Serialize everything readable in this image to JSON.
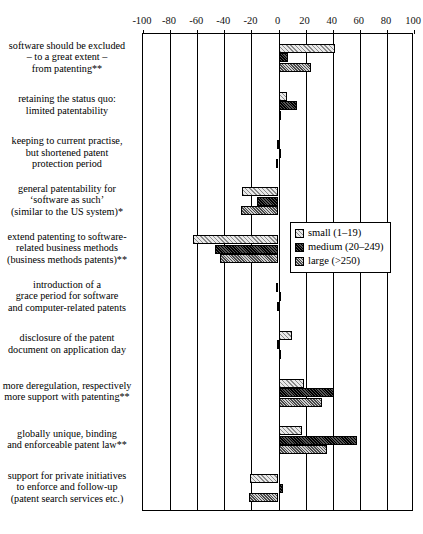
{
  "chart_data": {
    "type": "bar",
    "orientation": "horizontal",
    "title": "",
    "xlabel": "",
    "ylabel": "",
    "xlim": [
      -100,
      100
    ],
    "xticks": [
      -100,
      -80,
      -60,
      -40,
      -20,
      0,
      20,
      40,
      60,
      80,
      100
    ],
    "xtick_labels": [
      "-100",
      "-80",
      "-60",
      "-40",
      "-20",
      "0",
      "20",
      "40",
      "60",
      "80",
      "100"
    ],
    "grid": true,
    "legend_position": "center-right",
    "categories": [
      "software should be excluded\n– to a great extent –\nfrom patenting**",
      "retaining the status quo:\nlimited patentability",
      "keeping to current practise,\nbut shortened patent\nprotection period",
      "general patentability for\n‘software as such’\n(similar to the US system)*",
      "extend patenting to software-\nrelated business methods\n(business methods patents)**",
      "introduction of a\ngrace period for software\nand computer-related patents",
      "disclosure of the patent\ndocument on application day",
      "more deregulation, respectively\nmore support with patenting**",
      "globally unique, binding\nand enforceable patent law**",
      "support for private initiatives\nto enforce and follow-up\n(patent search services etc.)"
    ],
    "series": [
      {
        "name": "small (1–19)",
        "pattern": "pat-small",
        "values": [
          42,
          6,
          -1,
          -27,
          -63,
          -2,
          10,
          19,
          17,
          -21
        ]
      },
      {
        "name": "medium (20–249)",
        "pattern": "pat-medium",
        "values": [
          7,
          14,
          1,
          -16,
          -47,
          1,
          -1,
          41,
          58,
          3
        ]
      },
      {
        "name": "large (>250)",
        "pattern": "pat-large",
        "values": [
          24,
          0,
          -2,
          -28,
          -43,
          -1,
          0,
          32,
          36,
          -22
        ]
      }
    ]
  },
  "legend": {
    "items": [
      {
        "label": "small (1–19)",
        "pattern": "pat-small"
      },
      {
        "label": "medium (20–249)",
        "pattern": "pat-medium"
      },
      {
        "label": "large (>250)",
        "pattern": "pat-large"
      }
    ]
  }
}
